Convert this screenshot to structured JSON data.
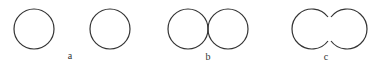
{
  "figure": {
    "stroke_color": "#333333",
    "panels": [
      {
        "id": "a",
        "label": "a",
        "description": "two separate circles"
      },
      {
        "id": "b",
        "label": "b",
        "description": "two tangent circles touching at one point"
      },
      {
        "id": "c",
        "label": "c",
        "description": "two merging circles with an open neck"
      }
    ]
  }
}
